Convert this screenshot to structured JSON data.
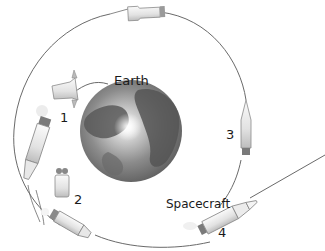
{
  "diagram": {
    "labels": {
      "earth": "Earth",
      "spacecraft": "Spacecraft",
      "step1": "1",
      "step2": "2",
      "step3": "3",
      "step4": "4"
    },
    "colors": {
      "orbit_line": "#6a6a6a",
      "earth_dark": "#5a5a5a",
      "earth_light": "#c9c9c9",
      "rocket_body": "#efefef",
      "rocket_outline": "#8a8a8a",
      "text": "#1a1a1a"
    }
  }
}
